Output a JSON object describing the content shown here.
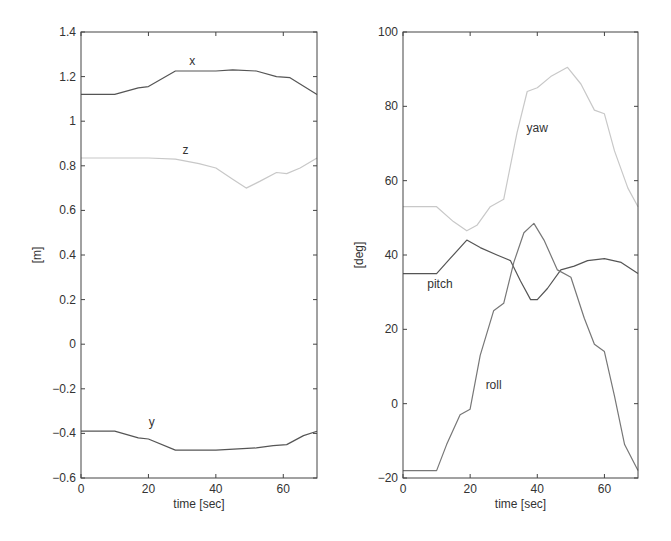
{
  "chart_data": [
    {
      "type": "line",
      "title": "",
      "xlabel": "time [sec]",
      "ylabel": "[m]",
      "xlim": [
        0,
        70
      ],
      "ylim": [
        -0.6,
        1.4
      ],
      "xticks": [
        0,
        20,
        40,
        60
      ],
      "yticks": [
        -0.6,
        -0.4,
        -0.2,
        0,
        0.2,
        0.4,
        0.6,
        0.8,
        1,
        1.2,
        1.4
      ],
      "ytick_labels": [
        "-0.6",
        "-0.4",
        "-0.2",
        "0",
        "0.2",
        "0.4",
        "0.6",
        "0.8",
        "1",
        "1.2",
        "1.4"
      ],
      "grid": false,
      "legend": "inline labels",
      "series": [
        {
          "name": "x",
          "color": "#555555",
          "label_pos": [
            33,
            1.25
          ],
          "x": [
            0,
            10,
            17,
            20,
            28,
            40,
            45,
            52,
            58,
            62,
            70
          ],
          "values": [
            1.12,
            1.12,
            1.15,
            1.155,
            1.225,
            1.225,
            1.23,
            1.225,
            1.2,
            1.195,
            1.12
          ]
        },
        {
          "name": "z",
          "color": "#c8c8c8",
          "label_pos": [
            31,
            0.855
          ],
          "x": [
            0,
            10,
            20,
            28,
            35,
            40,
            45,
            49,
            53,
            58,
            61,
            65,
            70
          ],
          "values": [
            0.835,
            0.835,
            0.835,
            0.83,
            0.81,
            0.79,
            0.74,
            0.7,
            0.73,
            0.77,
            0.765,
            0.79,
            0.835
          ]
        },
        {
          "name": "y",
          "color": "#555555",
          "label_pos": [
            21,
            -0.365
          ],
          "x": [
            0,
            10,
            17,
            20,
            28,
            40,
            52,
            57,
            61,
            66,
            70
          ],
          "values": [
            -0.39,
            -0.39,
            -0.42,
            -0.425,
            -0.475,
            -0.475,
            -0.465,
            -0.455,
            -0.45,
            -0.41,
            -0.39
          ]
        }
      ]
    },
    {
      "type": "line",
      "title": "",
      "xlabel": "time [sec]",
      "ylabel": "[deg]",
      "xlim": [
        0,
        70
      ],
      "ylim": [
        -20,
        100
      ],
      "xticks": [
        0,
        20,
        40,
        60
      ],
      "yticks": [
        -20,
        0,
        20,
        40,
        60,
        80,
        100
      ],
      "ytick_labels": [
        "-20",
        "0",
        "20",
        "40",
        "60",
        "80",
        "100"
      ],
      "grid": false,
      "legend": "inline labels",
      "series": [
        {
          "name": "yaw",
          "color": "#c8c8c8",
          "label_pos": [
            40,
            73
          ],
          "x": [
            0,
            10,
            15,
            19,
            22,
            26,
            30,
            34,
            37,
            40,
            44,
            49,
            53,
            57,
            60,
            63,
            67,
            70
          ],
          "values": [
            53,
            53,
            49,
            46.5,
            48,
            53,
            55,
            73,
            84,
            85,
            88,
            90.5,
            86,
            79,
            78,
            68,
            58,
            53
          ]
        },
        {
          "name": "pitch",
          "color": "#555555",
          "label_pos": [
            11,
            31
          ],
          "x": [
            0,
            10,
            14,
            19,
            23,
            28,
            32,
            35,
            38,
            40,
            43,
            47,
            51,
            55,
            60,
            65,
            70
          ],
          "values": [
            35,
            35,
            39,
            44,
            42,
            40,
            38.5,
            33,
            28,
            28,
            31,
            36,
            37,
            38.5,
            39,
            38,
            35
          ]
        },
        {
          "name": "roll",
          "color": "#777777",
          "label_pos": [
            27,
            4
          ],
          "x": [
            0,
            10,
            13,
            17,
            20,
            23,
            27,
            30,
            33,
            36,
            39,
            42,
            46,
            50,
            54,
            57,
            60,
            63,
            66,
            70
          ],
          "values": [
            -18,
            -18,
            -11,
            -3,
            -1.5,
            13,
            25,
            27,
            38,
            46,
            48.5,
            44,
            36,
            34,
            23,
            16,
            14,
            2,
            -11,
            -18
          ]
        }
      ]
    }
  ]
}
